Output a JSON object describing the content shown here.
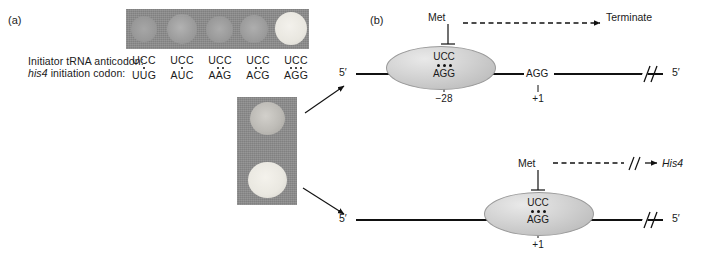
{
  "figure": {
    "panel_a": {
      "label": "(a)",
      "row_labels": {
        "anticodon": "Initiator tRNA anticodon:",
        "codon_italic": "his4",
        "codon_rest": " initiation codon:"
      },
      "codon_pairs": [
        {
          "anticodon": "UCC",
          "codon": "UUG",
          "pairs": 1
        },
        {
          "anticodon": "UCC",
          "codon": "AUC",
          "pairs": 1
        },
        {
          "anticodon": "UCC",
          "codon": "AAG",
          "pairs": 2
        },
        {
          "anticodon": "UCC",
          "codon": "ACG",
          "pairs": 2
        },
        {
          "anticodon": "UCC",
          "codon": "AGG",
          "pairs": 3
        }
      ],
      "top_plate": {
        "background_color": "#8d8d8d",
        "colonies": [
          {
            "brightness": "faint",
            "color": "#9a9a9a"
          },
          {
            "brightness": "faint",
            "color": "#a5a5a5"
          },
          {
            "brightness": "faint",
            "color": "#a0a0a0"
          },
          {
            "brightness": "faint",
            "color": "#a3a3a3"
          },
          {
            "brightness": "bright",
            "color": "#eceae4"
          }
        ]
      },
      "side_plate": {
        "background_color": "#8a8a8a",
        "colonies": [
          {
            "brightness": "medium",
            "color": "#c3c2bd"
          },
          {
            "brightness": "bright",
            "color": "#eeece6"
          }
        ]
      }
    },
    "panel_b": {
      "label": "(b)",
      "diagrams": [
        {
          "id": "non-productive-initiation",
          "met_label": "Met",
          "ribosome_anticodon": "UCC",
          "ribosome_codon": "AGG",
          "pair_dots": 3,
          "ribosome_position_label": "−28",
          "downstream_codon": "AGG",
          "downstream_position_label": "+1",
          "outcome_label": "Terminate",
          "five_prime_left": "5′",
          "five_prime_right": "5′",
          "has_break_symbol_on_mrna": true,
          "has_break_symbol_on_arrow": false
        },
        {
          "id": "productive-initiation",
          "met_label": "Met",
          "ribosome_anticodon": "UCC",
          "ribosome_codon": "AGG",
          "pair_dots": 3,
          "ribosome_position_label": "+1",
          "outcome_label": "His4",
          "five_prime_left": "5′",
          "five_prime_right": "5′",
          "has_break_symbol_on_mrna": true,
          "has_break_symbol_on_arrow": true
        }
      ]
    }
  }
}
